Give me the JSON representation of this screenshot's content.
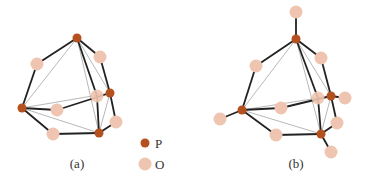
{
  "colors": {
    "P": "#b5501f",
    "O": "#efc4b0",
    "bond": "#222222",
    "edge": "#aaaaaa"
  },
  "panels": [
    {
      "label": "(a)",
      "label_pos": [
        77,
        161
      ],
      "P": [
        [
          77,
          38
        ],
        [
          22,
          108
        ],
        [
          110,
          93
        ],
        [
          99,
          133
        ]
      ],
      "O": [
        [
          37,
          64
        ],
        [
          100,
          57
        ],
        [
          57,
          110
        ],
        [
          97,
          96
        ],
        [
          116,
          122
        ],
        [
          53,
          134
        ]
      ],
      "bonds": [
        [
          0,
          "O0"
        ],
        [
          1,
          "O0"
        ],
        [
          0,
          "O1"
        ],
        [
          2,
          "O1"
        ],
        [
          1,
          "O2"
        ],
        [
          2,
          "O3"
        ],
        [
          0,
          3
        ],
        [
          2,
          "O4"
        ],
        [
          3,
          "O4"
        ],
        [
          1,
          "O5"
        ],
        [
          3,
          "O5"
        ]
      ],
      "edges": [
        [
          0,
          1
        ],
        [
          0,
          2
        ],
        [
          1,
          2
        ],
        [
          1,
          3
        ],
        [
          0,
          3
        ],
        [
          2,
          3
        ]
      ]
    },
    {
      "label": "(b)",
      "label_pos": [
        296,
        163
      ],
      "P": [
        [
          296,
          39
        ],
        [
          242,
          110
        ],
        [
          331,
          96
        ],
        [
          321,
          134
        ]
      ],
      "O": [
        [
          296,
          12
        ],
        [
          256,
          66
        ],
        [
          321,
          58
        ],
        [
          281,
          108
        ],
        [
          318,
          98
        ],
        [
          345,
          98
        ],
        [
          220,
          119
        ],
        [
          337,
          123
        ],
        [
          331,
          152
        ],
        [
          276,
          135
        ]
      ]
    }
  ],
  "legend": {
    "items": [
      {
        "symbol": "P",
        "label": "P"
      },
      {
        "symbol": "O",
        "label": "O"
      }
    ]
  }
}
